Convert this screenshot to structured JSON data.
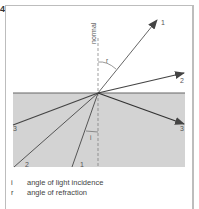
{
  "figure": {
    "number": "4"
  },
  "diagram": {
    "normal_label": "normal",
    "angle_r_label": "r",
    "angle_i_label": "i",
    "rays": {
      "refracted_1_label": "1",
      "refracted_2_label": "2",
      "reflected_3_label": "3",
      "incident_1_label": "1",
      "incident_2_label": "2",
      "incident_3_label": "3"
    },
    "colors": {
      "medium": "#d3d3d3",
      "surface": "#666666",
      "ray": "#555555",
      "frame": "#bdbdbd"
    }
  },
  "legend": {
    "items": [
      {
        "symbol": "i",
        "text": "angle of light incidence"
      },
      {
        "symbol": "r",
        "text": "angle of refraction"
      }
    ]
  }
}
